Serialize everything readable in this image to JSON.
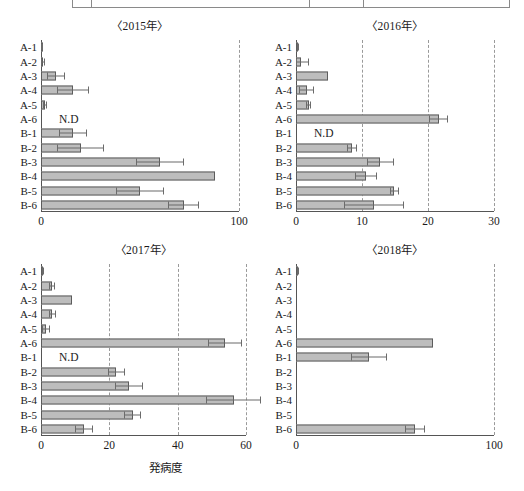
{
  "figure": {
    "x_axis_title": "発病度",
    "nd_label": "N.D",
    "categories": [
      "A-1",
      "A-2",
      "A-3",
      "A-4",
      "A-5",
      "A-6",
      "B-1",
      "B-2",
      "B-3",
      "B-4",
      "B-5",
      "B-6"
    ],
    "colors": {
      "bar_fill": "#bdbdbd",
      "bar_stroke": "#5c5c5c",
      "axis": "#555555",
      "grid": "#9a9a9a",
      "text": "#1a1a1a"
    }
  },
  "chart_data": [
    {
      "type": "bar",
      "title": "〈2015年〉",
      "orientation": "horizontal",
      "xlabel": "発病度",
      "ylabel": "",
      "xlim": [
        0,
        100
      ],
      "xticks": [
        0,
        100
      ],
      "xticklabels": [
        "0",
        "100"
      ],
      "gridlines": [
        100
      ],
      "grid": true,
      "categories": [
        "A-1",
        "A-2",
        "A-3",
        "A-4",
        "A-5",
        "A-6",
        "B-1",
        "B-2",
        "B-3",
        "B-4",
        "B-5",
        "B-6"
      ],
      "values": [
        0.5,
        1.0,
        7.5,
        16.0,
        2.0,
        null,
        16.0,
        20.0,
        60.0,
        88.0,
        50.0,
        72.0
      ],
      "errors": [
        0.3,
        1.2,
        4.5,
        8.0,
        1.2,
        null,
        7.0,
        12.0,
        12.0,
        0.0,
        12.0,
        8.0
      ],
      "not_detected": [
        "A-6"
      ]
    },
    {
      "type": "bar",
      "title": "〈2016年〉",
      "orientation": "horizontal",
      "xlabel": "発病度",
      "ylabel": "",
      "xlim": [
        0,
        30
      ],
      "xticks": [
        0,
        10,
        20,
        30
      ],
      "xticklabels": [
        "0",
        "10",
        "20",
        "30"
      ],
      "gridlines": [
        10,
        20,
        30
      ],
      "grid": true,
      "categories": [
        "A-1",
        "A-2",
        "A-3",
        "A-4",
        "A-5",
        "A-6",
        "B-1",
        "B-2",
        "B-3",
        "B-4",
        "B-5",
        "B-6"
      ],
      "values": [
        0.3,
        0.7,
        4.8,
        1.6,
        1.9,
        21.6,
        null,
        8.5,
        12.8,
        10.6,
        14.9,
        11.8
      ],
      "errors": [
        0.2,
        1.2,
        0.0,
        1.2,
        0.4,
        1.4,
        null,
        0.8,
        2.0,
        1.6,
        0.7,
        4.5
      ],
      "not_detected": [
        "B-1"
      ]
    },
    {
      "type": "bar",
      "title": "〈2017年〉",
      "orientation": "horizontal",
      "xlabel": "発病度",
      "ylabel": "",
      "xlim": [
        0,
        60
      ],
      "xticks": [
        0,
        20,
        40,
        60
      ],
      "xticklabels": [
        "0",
        "20",
        "40",
        "60"
      ],
      "gridlines": [
        20,
        40,
        60
      ],
      "grid": true,
      "categories": [
        "A-1",
        "A-2",
        "A-3",
        "A-4",
        "A-5",
        "A-6",
        "B-1",
        "B-2",
        "B-3",
        "B-4",
        "B-5",
        "B-6"
      ],
      "values": [
        0.4,
        3.2,
        9.2,
        3.3,
        1.5,
        53.8,
        null,
        22.0,
        25.8,
        56.4,
        26.8,
        12.5
      ],
      "errors": [
        0.2,
        1.0,
        0.0,
        1.0,
        1.2,
        5.0,
        null,
        2.5,
        4.0,
        8.0,
        2.6,
        2.6
      ],
      "not_detected": [
        "B-1"
      ]
    },
    {
      "type": "bar",
      "title": "〈2018年〉",
      "orientation": "horizontal",
      "xlabel": "発病度",
      "ylabel": "",
      "xlim": [
        0,
        100
      ],
      "xticks": [
        0,
        100
      ],
      "xticklabels": [
        "0",
        "100"
      ],
      "gridlines": [
        100
      ],
      "grid": true,
      "categories": [
        "A-1",
        "A-2",
        "A-3",
        "A-4",
        "A-5",
        "A-6",
        "B-1",
        "B-2",
        "B-3",
        "B-4",
        "B-5",
        "B-6"
      ],
      "values": [
        0.6,
        0.0,
        0.0,
        0.0,
        0.0,
        69.0,
        37.0,
        0.0,
        0.0,
        0.0,
        0.0,
        60.0
      ],
      "errors": [
        0.3,
        0,
        0,
        0,
        0,
        0.0,
        9.0,
        0,
        0,
        0,
        0,
        5.0
      ],
      "not_detected": []
    }
  ]
}
